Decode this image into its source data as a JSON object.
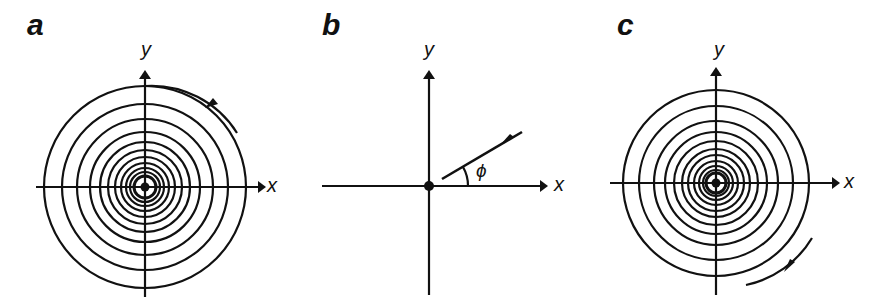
{
  "figure": {
    "panels": [
      {
        "id": "a",
        "label": "a",
        "x_axis_label": "x",
        "y_axis_label": "y",
        "description": "Spiral converging toward origin, counterclockwise arrow on outer arc",
        "arrow_direction": "counterclockwise"
      },
      {
        "id": "b",
        "label": "b",
        "x_axis_label": "x",
        "y_axis_label": "y",
        "angle_label": "ϕ",
        "description": "Straight line approaching origin at angle phi from x-axis, arrow pointing toward origin"
      },
      {
        "id": "c",
        "label": "c",
        "x_axis_label": "x",
        "y_axis_label": "y",
        "description": "Spiral converging toward origin, clockwise arrow on outer arc",
        "arrow_direction": "clockwise"
      }
    ],
    "colors": {
      "ink": "#111111",
      "background": "#ffffff"
    }
  }
}
